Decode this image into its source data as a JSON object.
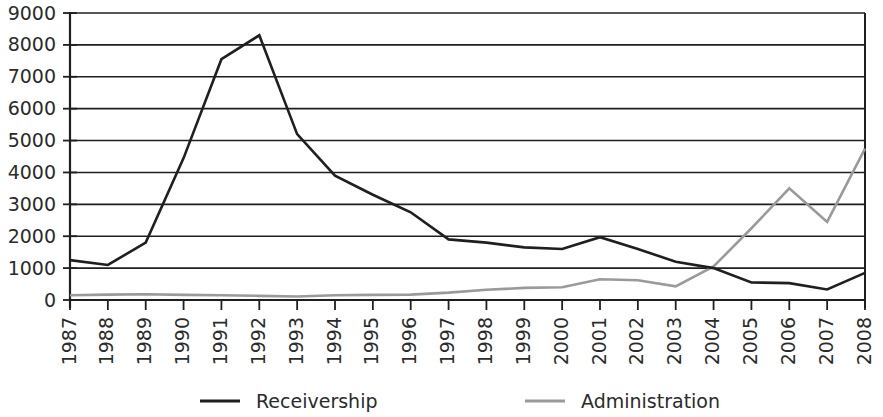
{
  "chart_data": {
    "type": "line",
    "title": "",
    "subtitle": "",
    "xlabel": "",
    "ylabel": "",
    "xlim": [
      1987,
      2008
    ],
    "ylim": [
      0,
      9000
    ],
    "ytick_step": 1000,
    "grid": true,
    "legend_position": "bottom",
    "x": [
      1987,
      1988,
      1989,
      1990,
      1991,
      1992,
      1993,
      1994,
      1995,
      1996,
      1997,
      1998,
      1999,
      2000,
      2001,
      2002,
      2003,
      2004,
      2005,
      2006,
      2007,
      2008
    ],
    "categories": [
      "1987",
      "1988",
      "1989",
      "1990",
      "1991",
      "1992",
      "1993",
      "1994",
      "1995",
      "1996",
      "1997",
      "1998",
      "1999",
      "2000",
      "2001",
      "2002",
      "2003",
      "2004",
      "2005",
      "2006",
      "2007",
      "2008"
    ],
    "ytick_labels": [
      "9000",
      "8000",
      "7000",
      "6000",
      "5000",
      "4000",
      "3000",
      "2000",
      "1000",
      "0"
    ],
    "ytick_values": [
      9000,
      8000,
      7000,
      6000,
      5000,
      4000,
      3000,
      2000,
      1000,
      0
    ],
    "series": [
      {
        "name": "Receivership",
        "color": "#1f1f1f",
        "stroke_width": 2.6,
        "values": [
          1250,
          1100,
          1800,
          4450,
          7550,
          8300,
          5200,
          3900,
          3300,
          2750,
          1900,
          1800,
          1650,
          1600,
          1970,
          1600,
          1200,
          1000,
          550,
          530,
          330,
          850
        ]
      },
      {
        "name": "Administration",
        "color": "#9a9a9a",
        "stroke_width": 2.6,
        "values": [
          150,
          170,
          180,
          160,
          150,
          130,
          110,
          150,
          160,
          170,
          230,
          320,
          380,
          400,
          650,
          620,
          430,
          1050,
          2250,
          3500,
          2450,
          4750
        ]
      }
    ]
  },
  "legend": {
    "items": [
      {
        "label": "Receivership",
        "color": "#1f1f1f"
      },
      {
        "label": "Administration",
        "color": "#9a9a9a"
      }
    ]
  }
}
